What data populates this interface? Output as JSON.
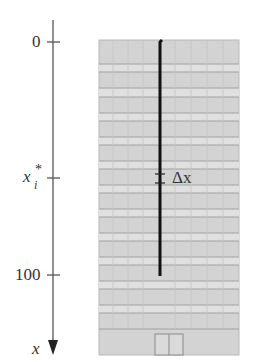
{
  "figure": {
    "type": "building-cable-diagram",
    "axis": {
      "variable_label": "x",
      "direction": "down",
      "ticks": [
        {
          "label": "0",
          "y": 42
        },
        {
          "label": "x_i*",
          "y": 178
        },
        {
          "label": "100",
          "y": 275
        }
      ]
    },
    "labels": {
      "tick_0": "0",
      "tick_100": "100",
      "tick_xi_base": "x",
      "tick_xi_sub": "i",
      "tick_xi_sup": "*",
      "axis_var": "x",
      "slice_label": "Δx"
    },
    "building": {
      "fill": "#d4d4d4",
      "band_light": "#e2e2e2",
      "line_color": "#9a9a9a",
      "floor_lines_y": [
        64,
        72,
        88,
        97,
        113,
        121,
        137,
        145,
        161,
        169,
        185,
        193,
        209,
        217,
        233,
        241,
        257,
        265,
        281,
        289,
        305,
        313,
        329
      ]
    },
    "cable": {
      "color": "#111111",
      "top_y": 40,
      "bottom_y": 276
    },
    "colors": {
      "axis": "#555555",
      "text": "#333333"
    }
  }
}
